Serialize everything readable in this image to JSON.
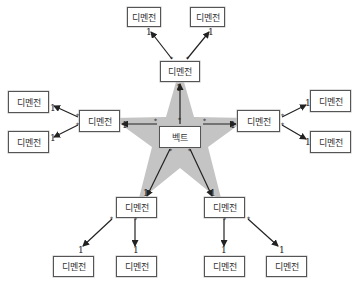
{
  "diagram": {
    "center": {
      "label": "벡트"
    },
    "node_label": "디멘전",
    "multiplicity_one": "1",
    "multiplicity_many": "*",
    "colors": {
      "star_fill": "#c4c4c4",
      "box_border": "#555555",
      "arrow": "#222222"
    },
    "nodes": [
      {
        "id": "top-mid",
        "label": "디멘전"
      },
      {
        "id": "left-mid",
        "label": "디멘전"
      },
      {
        "id": "right-mid",
        "label": "디멘전"
      },
      {
        "id": "bottom-left-mid",
        "label": "디멘전"
      },
      {
        "id": "bottom-right-mid",
        "label": "디멘전"
      },
      {
        "id": "top-left-outer",
        "label": "디멘전"
      },
      {
        "id": "top-right-outer",
        "label": "디멘전"
      },
      {
        "id": "left-top-outer",
        "label": "디멘전"
      },
      {
        "id": "left-bottom-outer",
        "label": "디멘전"
      },
      {
        "id": "right-top-outer",
        "label": "디멘전"
      },
      {
        "id": "right-bottom-outer",
        "label": "디멘전"
      },
      {
        "id": "bl-outer-1",
        "label": "디멘전"
      },
      {
        "id": "bl-outer-2",
        "label": "디멘전"
      },
      {
        "id": "br-outer-1",
        "label": "디멘전"
      },
      {
        "id": "br-outer-2",
        "label": "디멘전"
      }
    ]
  }
}
